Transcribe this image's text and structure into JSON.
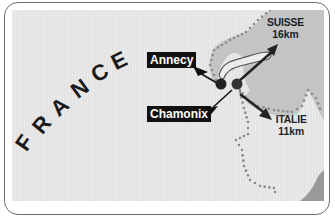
{
  "map": {
    "country_main": {
      "name": "FRANCE",
      "letters": [
        "F",
        "R",
        "A",
        "N",
        "C",
        "E"
      ]
    },
    "cities": [
      {
        "name": "Annecy",
        "marker_icon": "city-dot"
      },
      {
        "name": "Chamonix",
        "marker_icon": "city-dot"
      }
    ],
    "neighbors": [
      {
        "name": "SUISSE",
        "distance": "16km",
        "arrow_icon": "arrow-northeast"
      },
      {
        "name": "ITALIE",
        "distance": "11km",
        "arrow_icon": "arrow-southeast"
      }
    ],
    "colors": {
      "land_france": "#e4e4e4",
      "land_switzerland": "#c4c4c4",
      "lake": "#dcdcdc",
      "border_dots": "#8a8a8a",
      "label_bg": "#111111",
      "label_text": "#ffffff",
      "frame": "#6a6a6a"
    }
  }
}
